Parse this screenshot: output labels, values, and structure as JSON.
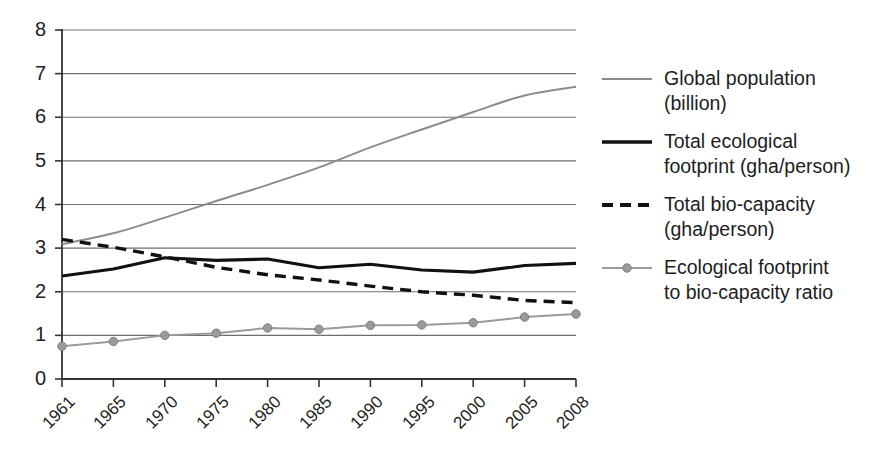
{
  "chart_data": {
    "type": "line",
    "title": "",
    "xlabel": "",
    "ylabel": "",
    "xlim": [
      1961,
      2008
    ],
    "ylim": [
      0,
      8
    ],
    "grid": true,
    "legend_position": "right",
    "categories": [
      "1961",
      "1965",
      "1970",
      "1975",
      "1980",
      "1985",
      "1990",
      "1995",
      "2000",
      "2005",
      "2008"
    ],
    "x": [
      1961,
      1965,
      1970,
      1975,
      1980,
      1985,
      1990,
      1995,
      2000,
      2005,
      2008
    ],
    "yticks": [
      "0",
      "1",
      "2",
      "3",
      "4",
      "5",
      "6",
      "7",
      "8"
    ],
    "series": [
      {
        "name": "Global population (billion)",
        "style": "thin-solid",
        "color": "#8c8c8c",
        "marker": "none",
        "values": [
          3.09,
          3.34,
          3.7,
          4.08,
          4.45,
          4.85,
          5.31,
          5.72,
          6.12,
          6.5,
          6.7
        ]
      },
      {
        "name": "Total ecological footprint (gha/person)",
        "style": "thick-solid",
        "color": "#111111",
        "marker": "none",
        "values": [
          2.36,
          2.52,
          2.78,
          2.72,
          2.75,
          2.55,
          2.63,
          2.5,
          2.45,
          2.6,
          2.65
        ]
      },
      {
        "name": "Total bio-capacity (gha/person)",
        "style": "thick-dashed",
        "color": "#111111",
        "marker": "none",
        "values": [
          3.2,
          3.02,
          2.8,
          2.56,
          2.39,
          2.27,
          2.13,
          2.0,
          1.92,
          1.8,
          1.75
        ]
      },
      {
        "name": "Ecological footprint to bio-capacity ratio",
        "style": "thin-solid-marker",
        "color": "#9a9a9a",
        "marker": "circle",
        "values": [
          0.75,
          0.86,
          1.0,
          1.05,
          1.17,
          1.14,
          1.23,
          1.24,
          1.29,
          1.42,
          1.49
        ]
      }
    ]
  },
  "legend": {
    "items": [
      {
        "label": "Global population\n(billion)",
        "sample": "thin-line-sample"
      },
      {
        "label": "Total ecological\nfootprint (gha/person)",
        "sample": "thick-line-sample"
      },
      {
        "label": "Total bio-capacity\n(gha/person)",
        "sample": "dashed-line-sample"
      },
      {
        "label": "Ecological footprint\nto bio-capacity ratio",
        "sample": "marker-line-sample"
      }
    ]
  },
  "colors": {
    "axis": "#333333",
    "grid": "#6e6e6e",
    "population_line": "#8c8c8c",
    "footprint_line": "#111111",
    "biocapacity_line": "#111111",
    "ratio_line": "#9a9a9a",
    "background": "#ffffff"
  }
}
